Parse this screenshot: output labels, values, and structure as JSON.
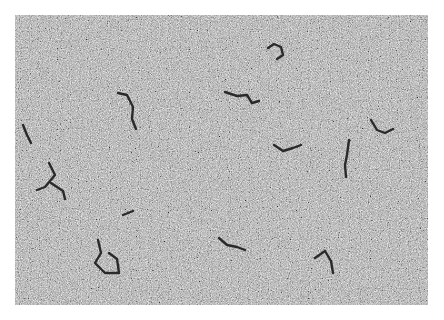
{
  "image": {
    "subject": "electron micrograph of filamentous molecules on grainy background",
    "background_color": "#a9a9a9",
    "strand_color": "#2a2a2a",
    "strands": [
      "M103,78 L112,80 L118,92 L117,104 L121,114",
      "M253,33 L259,29 L266,32 L268,40 L262,44",
      "M210,77 L222,81 L232,80 L237,88 L244,86",
      "M8,110 L12,120 L16,128",
      "M356,105 L362,115 L370,118 L378,114",
      "M259,130 L268,136 L278,133 L286,130",
      "M334,125 L332,140 L330,150 L331,162",
      "M34,148 L40,160 L30,172 L22,175",
      "M36,168 L48,176 L50,184",
      "M83,225 L86,238 L80,248 L90,258 L104,258 L102,244 L94,238",
      "M204,223 L212,230 L222,232 L230,235",
      "M300,243 L310,236 L316,246 L318,258",
      "M108,200 L118,196"
    ]
  }
}
